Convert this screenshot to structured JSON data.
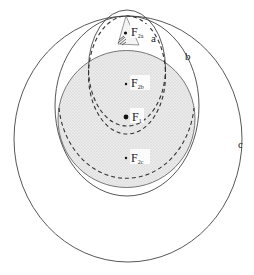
{
  "diagram": {
    "type": "nested-ellipses",
    "colors": {
      "stroke": "#3a3a3a",
      "shade": "#e2e2e2",
      "background": "#ffffff"
    },
    "curves": [
      {
        "id": "a",
        "label": "a",
        "style": "solid+dashed",
        "description": "smallest ellipse through top point"
      },
      {
        "id": "b",
        "label": "b",
        "style": "solid",
        "description": "middle ellipse through top point"
      },
      {
        "id": "c",
        "label": "c",
        "style": "solid",
        "description": "outer ellipse through top point"
      }
    ],
    "shaded_circle": {
      "description": "stippled circle around F1"
    },
    "foci": [
      {
        "id": "F1",
        "main": "F",
        "sub": "1"
      },
      {
        "id": "F2a",
        "main": "F",
        "sub": "2a"
      },
      {
        "id": "F2b",
        "main": "F",
        "sub": "2b"
      },
      {
        "id": "F2c",
        "main": "F",
        "sub": "2c"
      }
    ]
  },
  "labels": {
    "a": "a",
    "b": "b",
    "c": "c",
    "F1_main": "F",
    "F1_sub": "1",
    "F2a_main": "F",
    "F2a_sub": "2a",
    "F2b_main": "F",
    "F2b_sub": "2b",
    "F2c_main": "F",
    "F2c_sub": "2c"
  }
}
